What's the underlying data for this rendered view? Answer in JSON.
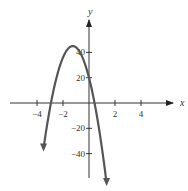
{
  "chart_data": {
    "type": "line",
    "title": "",
    "xlabel": "x",
    "ylabel": "y",
    "function": "y = -16x^2 - 40x + 20",
    "xlim": [
      -6,
      6
    ],
    "ylim": [
      -60,
      60
    ],
    "x_ticks": [
      -4,
      -2,
      2,
      4
    ],
    "x_tick_labels": [
      "−4",
      "−2",
      "2",
      "4"
    ],
    "y_ticks": [
      40,
      20,
      -20,
      -40
    ],
    "y_tick_labels": [
      "40",
      "20",
      "−20",
      "−40"
    ],
    "grid": false,
    "legend": "none",
    "series": [
      {
        "name": "parabola",
        "color": "#555555",
        "x": [
          -3.5,
          -3.0,
          -2.5,
          -2.0,
          -1.5,
          -1.25,
          -1.0,
          -0.5,
          0.0,
          0.5,
          1.0,
          1.35
        ],
        "values": [
          -56,
          -4,
          20,
          36,
          44,
          45,
          44,
          36,
          20,
          -4,
          -36,
          -63
        ]
      }
    ],
    "features": {
      "vertex": [
        -1.25,
        45
      ],
      "y_intercept": 20,
      "x_intercepts": [
        -2.93,
        0.43
      ]
    }
  }
}
